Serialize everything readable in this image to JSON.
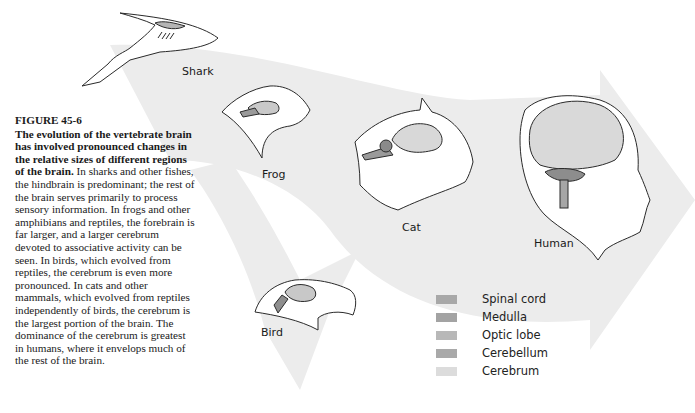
{
  "figure": {
    "number": "FIGURE 45-6",
    "lead": "The evolution of the vertebrate brain has involved pronounced changes in the relative sizes of different regions of the brain.",
    "body": " In sharks and other fishes, the hindbrain is predominant; the rest of the brain serves primarily to process sensory information. In frogs and other amphibians and reptiles, the forebrain is far larger, and a larger cerebrum devoted to associative activity can be seen. In birds, which evolved from reptiles, the cerebrum is even more pronounced. In cats and other mammals, which evolved from reptiles independently of birds, the cerebrum is the largest portion of the brain. The dominance of the cerebrum is greatest in humans, where it envelops much of the rest of the brain."
  },
  "animals": [
    {
      "name": "Shark"
    },
    {
      "name": "Frog"
    },
    {
      "name": "Cat"
    },
    {
      "name": "Human"
    },
    {
      "name": "Bird"
    }
  ],
  "legend": [
    {
      "label": "Spinal cord",
      "color": "#a8a8a8"
    },
    {
      "label": "Medulla",
      "color": "#a3a3a3"
    },
    {
      "label": "Optic lobe",
      "color": "#b8b8b8"
    },
    {
      "label": "Cerebellum",
      "color": "#a9a9a9"
    },
    {
      "label": "Cerebrum",
      "color": "#dcdcdc"
    }
  ],
  "colors": {
    "arrow_fill": "#ebebeb",
    "outline": "#2a2a2a"
  }
}
